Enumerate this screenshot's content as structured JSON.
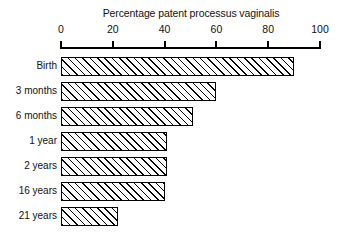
{
  "chart_data": {
    "type": "bar",
    "orientation": "horizontal",
    "title": "Percentage patent processus vaginalis",
    "xlabel": "",
    "ylabel": "",
    "xlim": [
      0,
      100
    ],
    "ylim": null,
    "grid": false,
    "legend": null,
    "axis_position": "top",
    "tick_labels": [
      "0",
      "20",
      "40",
      "60",
      "80",
      "100"
    ],
    "ticks": [
      0,
      20,
      40,
      60,
      80,
      100
    ],
    "categories": [
      "Birth",
      "3 months",
      "6 months",
      "1 year",
      "2 years",
      "16 years",
      "21 years"
    ],
    "values": [
      90,
      60,
      51,
      41,
      41,
      40,
      22
    ],
    "bar_style": {
      "fill": "#ffffff",
      "hatch": "forward-diagonal",
      "edge_color": "#000000"
    }
  }
}
